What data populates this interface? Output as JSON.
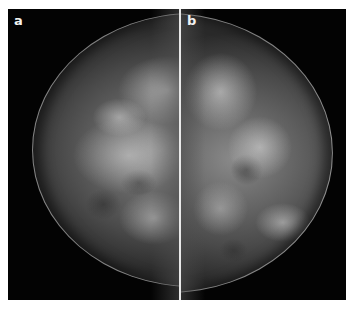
{
  "figure": {
    "panels": [
      {
        "label": "a",
        "view": "mammogram-left-panel"
      },
      {
        "label": "b",
        "view": "mammogram-right-panel"
      }
    ],
    "colors": {
      "background": "#ffffff",
      "image_background": "#020202",
      "divider": "#e8e8e8",
      "label": "#f2f2f2"
    }
  }
}
